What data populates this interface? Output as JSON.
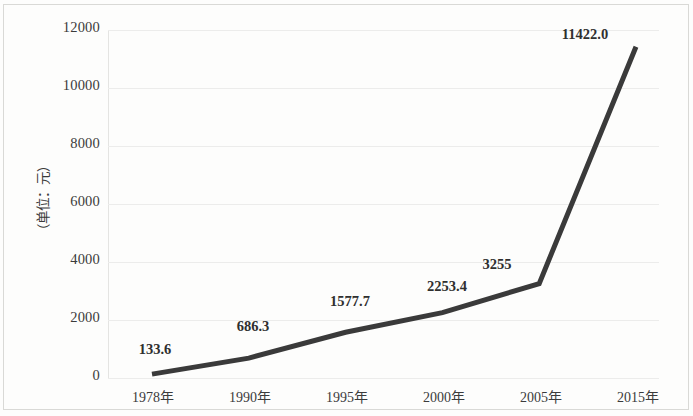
{
  "chart_data": {
    "type": "line",
    "title": "",
    "subtitle": "",
    "xlabel": "",
    "ylabel": "（单位：元）",
    "categories": [
      "1978年",
      "1990年",
      "1995年",
      "2000年",
      "2005年",
      "2015年"
    ],
    "values": [
      133.6,
      686.3,
      1577.7,
      2253.4,
      3255,
      11422.0
    ],
    "point_labels": [
      "133.6",
      "686.3",
      "1577.7",
      "2253.4",
      "3255",
      "11422.0"
    ],
    "series": [
      {
        "name": "",
        "values": [
          133.6,
          686.3,
          1577.7,
          2253.4,
          3255,
          11422.0
        ]
      }
    ],
    "ylim": [
      0,
      12000
    ],
    "ytick_labels": [
      "0",
      "2000",
      "4000",
      "6000",
      "8000",
      "10000",
      "12000"
    ],
    "ytick_values": [
      0,
      2000,
      4000,
      6000,
      8000,
      10000,
      12000
    ],
    "grid": true,
    "grid_axis": "y",
    "legend": false,
    "legend_position": "none",
    "line_color": "#3a3a3a",
    "line_width": 5,
    "markers": false,
    "data_labels_shown": true,
    "background_color": "#fdfdfc",
    "grid_color": "#ececeb",
    "text_color": "#3b3b3b"
  }
}
